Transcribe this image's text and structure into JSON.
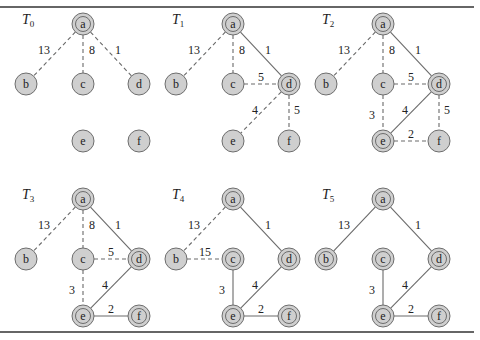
{
  "figure": {
    "nodes": [
      "a",
      "b",
      "c",
      "d",
      "e",
      "f"
    ],
    "panels": [
      {
        "title": "T",
        "subscript": "0",
        "tree_nodes": [
          "a"
        ],
        "edges": [
          {
            "from": "a",
            "to": "b",
            "weight": "13",
            "style": "dashed"
          },
          {
            "from": "a",
            "to": "c",
            "weight": "8",
            "style": "dashed"
          },
          {
            "from": "a",
            "to": "d",
            "weight": "1",
            "style": "dashed"
          }
        ]
      },
      {
        "title": "T",
        "subscript": "1",
        "tree_nodes": [
          "a",
          "d"
        ],
        "edges": [
          {
            "from": "a",
            "to": "b",
            "weight": "13",
            "style": "dashed"
          },
          {
            "from": "a",
            "to": "c",
            "weight": "8",
            "style": "dashed"
          },
          {
            "from": "a",
            "to": "d",
            "weight": "1",
            "style": "solid"
          },
          {
            "from": "c",
            "to": "d",
            "weight": "5",
            "style": "dashed"
          },
          {
            "from": "d",
            "to": "e",
            "weight": "4",
            "style": "dashed"
          },
          {
            "from": "d",
            "to": "f",
            "weight": "5",
            "style": "dashed"
          }
        ]
      },
      {
        "title": "T",
        "subscript": "2",
        "tree_nodes": [
          "a",
          "d",
          "e"
        ],
        "edges": [
          {
            "from": "a",
            "to": "b",
            "weight": "13",
            "style": "dashed"
          },
          {
            "from": "a",
            "to": "c",
            "weight": "8",
            "style": "dashed"
          },
          {
            "from": "a",
            "to": "d",
            "weight": "1",
            "style": "solid"
          },
          {
            "from": "c",
            "to": "d",
            "weight": "5",
            "style": "dashed"
          },
          {
            "from": "d",
            "to": "e",
            "weight": "4",
            "style": "solid"
          },
          {
            "from": "d",
            "to": "f",
            "weight": "5",
            "style": "dashed"
          },
          {
            "from": "c",
            "to": "e",
            "weight": "3",
            "style": "dashed"
          },
          {
            "from": "e",
            "to": "f",
            "weight": "2",
            "style": "dashed"
          }
        ]
      },
      {
        "title": "T",
        "subscript": "3",
        "tree_nodes": [
          "a",
          "d",
          "e",
          "f"
        ],
        "edges": [
          {
            "from": "a",
            "to": "b",
            "weight": "13",
            "style": "dashed"
          },
          {
            "from": "a",
            "to": "c",
            "weight": "8",
            "style": "dashed"
          },
          {
            "from": "a",
            "to": "d",
            "weight": "1",
            "style": "solid"
          },
          {
            "from": "c",
            "to": "d",
            "weight": "5",
            "style": "dashed"
          },
          {
            "from": "d",
            "to": "e",
            "weight": "4",
            "style": "solid"
          },
          {
            "from": "c",
            "to": "e",
            "weight": "3",
            "style": "dashed"
          },
          {
            "from": "e",
            "to": "f",
            "weight": "2",
            "style": "solid"
          }
        ]
      },
      {
        "title": "T",
        "subscript": "4",
        "tree_nodes": [
          "a",
          "c",
          "d",
          "e",
          "f"
        ],
        "edges": [
          {
            "from": "a",
            "to": "b",
            "weight": "13",
            "style": "dashed"
          },
          {
            "from": "b",
            "to": "c",
            "weight": "15",
            "style": "dashed"
          },
          {
            "from": "a",
            "to": "d",
            "weight": "1",
            "style": "solid"
          },
          {
            "from": "d",
            "to": "e",
            "weight": "4",
            "style": "solid"
          },
          {
            "from": "c",
            "to": "e",
            "weight": "3",
            "style": "solid"
          },
          {
            "from": "e",
            "to": "f",
            "weight": "2",
            "style": "solid"
          }
        ]
      },
      {
        "title": "T",
        "subscript": "5",
        "tree_nodes": [
          "a",
          "b",
          "c",
          "d",
          "e",
          "f"
        ],
        "edges": [
          {
            "from": "a",
            "to": "b",
            "weight": "13",
            "style": "solid"
          },
          {
            "from": "a",
            "to": "d",
            "weight": "1",
            "style": "solid"
          },
          {
            "from": "d",
            "to": "e",
            "weight": "4",
            "style": "solid"
          },
          {
            "from": "c",
            "to": "e",
            "weight": "3",
            "style": "solid"
          },
          {
            "from": "e",
            "to": "f",
            "weight": "2",
            "style": "solid"
          }
        ]
      }
    ]
  },
  "colors": {
    "node_fill": "#cfcfcf",
    "node_stroke": "#6d6d6d",
    "edge": "#6a6a6a",
    "rule": "#333333"
  }
}
